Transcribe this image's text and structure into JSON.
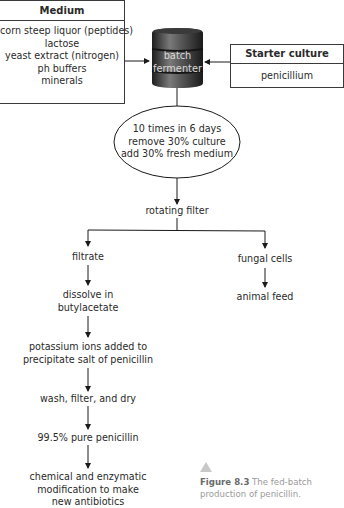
{
  "medium": {
    "title": "Medium",
    "items": [
      "corn steep liquor (peptides)",
      "lactose",
      "yeast extract (nitrogen)",
      "ph buffers",
      "minerals"
    ]
  },
  "fermenter": {
    "line1": "batch",
    "line2": "fermenter",
    "icon": "barrel-icon"
  },
  "starter": {
    "title": "Starter culture",
    "item": "penicillium"
  },
  "process": {
    "line1": "10 times in 6 days",
    "line2": "remove 30% culture",
    "line3": "add 30% fresh medium"
  },
  "filter": "rotating filter",
  "left_branch": {
    "filtrate": "filtrate",
    "dissolve": [
      "dissolve in",
      "butylacetate"
    ],
    "potassium": [
      "potassium ions added to",
      "precipitate salt of penicillin"
    ],
    "wash": "wash, filter, and dry",
    "pure": "99.5% pure penicillin",
    "modify": [
      "chemical and enzymatic",
      "modification to make",
      "new antibiotics"
    ]
  },
  "right_branch": {
    "cells": "fungal cells",
    "feed": "animal feed"
  },
  "caption": {
    "label": "Figure 8.3",
    "text1": "The fed-batch",
    "text2": "production of penicillin."
  },
  "colors": {
    "line": "#1a1a1a",
    "barrel_dark": "#2b2b2b",
    "barrel_light": "#8a8a8a",
    "caption_triangle": "#c8c8c8"
  }
}
